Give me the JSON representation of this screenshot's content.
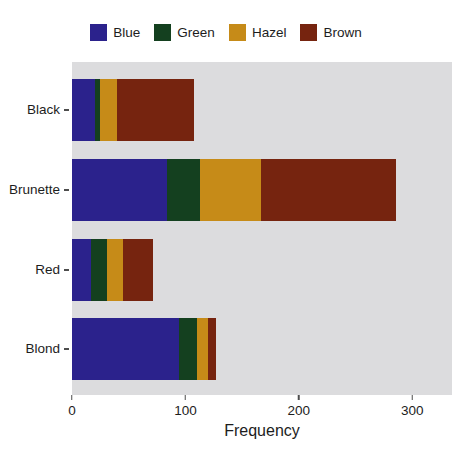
{
  "chart_data": {
    "type": "bar",
    "orientation": "horizontal",
    "stacked": true,
    "title": "",
    "xlabel": "Frequency",
    "ylabel": "",
    "categories": [
      "Black",
      "Brunette",
      "Red",
      "Blond"
    ],
    "category_order_top_to_bottom": [
      "Black",
      "Brunette",
      "Red",
      "Blond"
    ],
    "series": [
      {
        "name": "Blue",
        "color": "#2b228c",
        "values": [
          20,
          84,
          17,
          94
        ]
      },
      {
        "name": "Green",
        "color": "#14401f",
        "values": [
          5,
          29,
          14,
          16
        ]
      },
      {
        "name": "Hazel",
        "color": "#c68b18",
        "values": [
          15,
          54,
          14,
          10
        ]
      },
      {
        "name": "Brown",
        "color": "#76240f",
        "values": [
          68,
          119,
          26,
          7
        ]
      }
    ],
    "totals": [
      108,
      286,
      71,
      127
    ],
    "xlim": [
      0,
      335
    ],
    "xticks": [
      0,
      100,
      200,
      300
    ],
    "xtick_labels": [
      "0",
      "100",
      "200",
      "300"
    ],
    "grid": false,
    "legend_position": "top",
    "panel_background": "#dcdcde",
    "figure_background": "#ffffff"
  },
  "legend": {
    "items": [
      {
        "label": "Blue",
        "color": "#2b228c"
      },
      {
        "label": "Green",
        "color": "#14401f"
      },
      {
        "label": "Hazel",
        "color": "#c68b18"
      },
      {
        "label": "Brown",
        "color": "#76240f"
      }
    ]
  },
  "axes": {
    "x": {
      "title": "Frequency",
      "ticks": [
        {
          "value": 0,
          "label": "0"
        },
        {
          "value": 100,
          "label": "100"
        },
        {
          "value": 200,
          "label": "200"
        },
        {
          "value": 300,
          "label": "300"
        }
      ]
    },
    "y": {
      "title": "",
      "ticks": [
        {
          "label": "Black"
        },
        {
          "label": "Brunette"
        },
        {
          "label": "Red"
        },
        {
          "label": "Blond"
        }
      ]
    }
  }
}
